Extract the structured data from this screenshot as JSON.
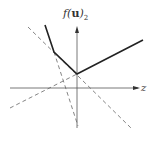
{
  "diagram": {
    "y_axis_label_fn": "f(",
    "y_axis_label_var": "u",
    "y_axis_label_close": ")",
    "y_axis_label_sub": "2",
    "x_axis_label": "z",
    "solid_polyline": [
      [
        45,
        25
      ],
      [
        54,
        52
      ],
      [
        77,
        74
      ],
      [
        143,
        40
      ]
    ],
    "dashed_lines": [
      {
        "from": [
          28,
          27
        ],
        "to": [
          131,
          128
        ]
      },
      {
        "from": [
          10,
          108
        ],
        "to": [
          77,
          74
        ]
      },
      {
        "from": [
          45,
          25
        ],
        "to": [
          78,
          126
        ]
      }
    ]
  }
}
